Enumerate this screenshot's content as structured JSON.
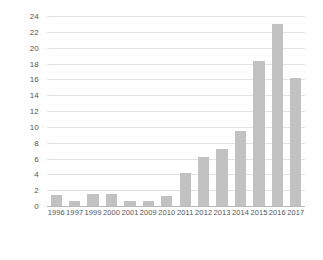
{
  "chart_data": {
    "type": "bar",
    "title": "",
    "subtitle": "",
    "xlabel": "",
    "ylabel": "",
    "categories": [
      "1996",
      "1997",
      "1999",
      "2000",
      "2001",
      "2009",
      "2010",
      "2011",
      "2012",
      "2013",
      "2014",
      "2015",
      "2016",
      "2017"
    ],
    "values": [
      1.4,
      0.6,
      1.5,
      1.5,
      0.6,
      0.6,
      1.3,
      4.2,
      6.2,
      7.2,
      9.5,
      18.3,
      23.0,
      16.2
    ],
    "ylim": [
      0,
      24
    ],
    "ytick_step": 2,
    "yticks": [
      "0",
      "2",
      "4",
      "6",
      "8",
      "10",
      "12",
      "14",
      "16",
      "18",
      "20",
      "22",
      "24"
    ],
    "grid": true,
    "legend": "none",
    "bar_color": "#c2c2c2",
    "grid_color": "#e3e3e3",
    "axis_color": "#b9b9b9",
    "tick_label_color": "#555555"
  }
}
